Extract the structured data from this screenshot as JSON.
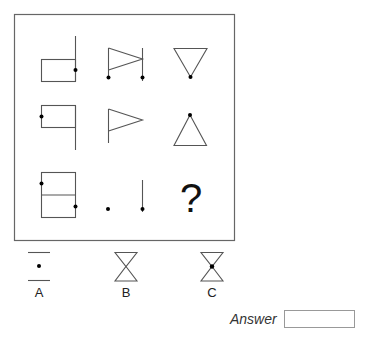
{
  "puzzle": {
    "grid": {
      "rows": 3,
      "cols": 3,
      "cells": [
        {
          "row": 1,
          "col": 1,
          "description": "rectangle with vertical line on right extending up, dot on right edge"
        },
        {
          "row": 1,
          "col": 2,
          "description": "flag triangle between two vertical lines, dots at bottom of each line"
        },
        {
          "row": 1,
          "col": 3,
          "description": "downward triangle with dot at bottom apex"
        },
        {
          "row": 2,
          "col": 1,
          "description": "rectangle with vertical line on right extending down, dot on left edge"
        },
        {
          "row": 2,
          "col": 2,
          "description": "flag triangle on vertical line"
        },
        {
          "row": 2,
          "col": 3,
          "description": "upward triangle with dot at top apex"
        },
        {
          "row": 3,
          "col": 1,
          "description": "rectangle split horizontally, dot on upper-left and lower-right edges"
        },
        {
          "row": 3,
          "col": 2,
          "description": "dot and vertical line with dot at bottom"
        },
        {
          "row": 3,
          "col": 3,
          "description": "missing",
          "symbol": "?"
        }
      ]
    },
    "question_mark": "?",
    "options": [
      {
        "label": "A",
        "description": "two horizontal lines with a dot between"
      },
      {
        "label": "B",
        "description": "hourglass shape (two triangles tip to tip)"
      },
      {
        "label": "C",
        "description": "hourglass shape with dot at center"
      }
    ],
    "answer": {
      "label": "Answer",
      "value": ""
    }
  },
  "colors": {
    "stroke": "#555555",
    "dot": "#000000",
    "frame": "#666666"
  }
}
